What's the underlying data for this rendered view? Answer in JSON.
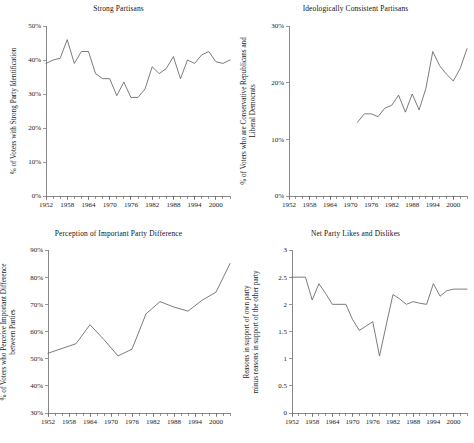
{
  "figure": {
    "background": "#ffffff",
    "line_color": "#5a5a5a",
    "axis_color": "#6b6b6b",
    "text_color": "#1a1a1a"
  },
  "panels": [
    {
      "key": "strong_partisans",
      "title": "Strong Partisans",
      "ylabel": "% of Voters with Strong Party Identification",
      "xlabel": "",
      "ytick_labels": [
        "0%",
        "10%",
        "20%",
        "30%",
        "40%",
        "50%"
      ],
      "xtick_labels": [
        "1952",
        "1958",
        "1964",
        "1970",
        "1976",
        "1982",
        "1988",
        "1994",
        "2000"
      ]
    },
    {
      "key": "ideologically_consistent",
      "title": "Ideologically Consistent Partisans",
      "ylabel_line1": "% of Voters who are Conservative Republicans and",
      "ylabel_line2": "Liberal Democrats",
      "xlabel": "",
      "ytick_labels": [
        "0%",
        "10%",
        "20%",
        "30%"
      ],
      "xtick_labels": [
        "1952",
        "1958",
        "1964",
        "1970",
        "1976",
        "1982",
        "1988",
        "1994",
        "2000"
      ]
    },
    {
      "key": "party_difference",
      "title": "Perception of Important Party Difference",
      "ylabel_line1": "% of Voters who Perceive Important Difference",
      "ylabel_line2": "between Parties",
      "xlabel": "",
      "ytick_labels": [
        "30%",
        "40%",
        "50%",
        "60%",
        "70%",
        "80%",
        "90%"
      ],
      "xtick_labels": [
        "1952",
        "1958",
        "1964",
        "1970",
        "1976",
        "1982",
        "1988",
        "1994",
        "2000"
      ]
    },
    {
      "key": "net_likes_dislikes",
      "title": "Net Party Likes and Dislikes",
      "ylabel_line1": "Reasons in support of own party",
      "ylabel_line2": "minus reasons in support of the other party",
      "xlabel": "",
      "ytick_labels": [
        "0",
        "0.5",
        "1",
        "1.5",
        "2",
        "2.5",
        "3"
      ],
      "xtick_labels": [
        "1952",
        "1958",
        "1964",
        "1970",
        "1976",
        "1982",
        "1988",
        "1994",
        "2000"
      ]
    }
  ],
  "chart_data": [
    {
      "type": "line",
      "title": "Strong Partisans",
      "xlabel": "",
      "ylabel": "% of Voters with Strong Party Identification",
      "xlim": [
        1952,
        2004
      ],
      "ylim": [
        0,
        50
      ],
      "ytick_values": [
        0,
        10,
        20,
        30,
        40,
        50
      ],
      "ytick_labels": [
        "0%",
        "10%",
        "20%",
        "30%",
        "40%",
        "50%"
      ],
      "xtick_values": [
        1952,
        1958,
        1964,
        1970,
        1976,
        1982,
        1988,
        1994,
        2000
      ],
      "minor_xtick_step": 2,
      "grid": false,
      "legend": "none",
      "x": [
        1952,
        1954,
        1956,
        1958,
        1960,
        1962,
        1964,
        1966,
        1968,
        1970,
        1972,
        1974,
        1976,
        1978,
        1980,
        1982,
        1984,
        1986,
        1988,
        1990,
        1992,
        1994,
        1996,
        1998,
        2000,
        2002,
        2004
      ],
      "values": [
        39.0,
        40.0,
        40.5,
        46.0,
        39.0,
        42.5,
        42.5,
        36.0,
        34.5,
        34.5,
        29.5,
        33.5,
        29.0,
        29.0,
        31.5,
        38.0,
        36.0,
        37.5,
        41.0,
        34.5,
        40.0,
        39.0,
        41.5,
        42.5,
        39.5,
        39.0,
        40.0
      ]
    },
    {
      "type": "line",
      "title": "Ideologically Consistent Partisans",
      "xlabel": "",
      "ylabel": "% of Voters who are Conservative Republicans and Liberal Democrats",
      "xlim": [
        1952,
        2004
      ],
      "ylim": [
        0,
        30
      ],
      "ytick_values": [
        0,
        10,
        20,
        30
      ],
      "ytick_labels": [
        "0%",
        "10%",
        "20%",
        "30%"
      ],
      "xtick_values": [
        1952,
        1958,
        1964,
        1970,
        1976,
        1982,
        1988,
        1994,
        2000
      ],
      "minor_xtick_step": 2,
      "grid": false,
      "legend": "none",
      "x": [
        1972,
        1974,
        1976,
        1978,
        1980,
        1982,
        1984,
        1986,
        1988,
        1990,
        1992,
        1994,
        1996,
        1998,
        2000,
        2002,
        2004
      ],
      "values": [
        13.0,
        14.5,
        14.5,
        14.0,
        15.5,
        16.0,
        17.8,
        14.8,
        18.0,
        15.2,
        19.0,
        25.5,
        23.0,
        21.5,
        20.3,
        22.5,
        26.0
      ]
    },
    {
      "type": "line",
      "title": "Perception of Important Party Difference",
      "xlabel": "",
      "ylabel": "% of Voters who Perceive Important Difference between Parties",
      "xlim": [
        1952,
        2004
      ],
      "ylim": [
        30,
        90
      ],
      "ytick_values": [
        30,
        40,
        50,
        60,
        70,
        80,
        90
      ],
      "ytick_labels": [
        "30%",
        "40%",
        "50%",
        "60%",
        "70%",
        "80%",
        "90%"
      ],
      "xtick_values": [
        1952,
        1958,
        1964,
        1970,
        1976,
        1982,
        1988,
        1994,
        2000
      ],
      "minor_xtick_step": 2,
      "grid": false,
      "legend": "none",
      "x": [
        1952,
        1960,
        1964,
        1968,
        1972,
        1976,
        1980,
        1984,
        1988,
        1992,
        1996,
        2000,
        2004
      ],
      "values": [
        52.0,
        55.5,
        62.5,
        57.0,
        51.0,
        53.5,
        66.5,
        71.0,
        69.0,
        67.5,
        71.5,
        74.5,
        85.0
      ]
    },
    {
      "type": "line",
      "title": "Net Party Likes and Dislikes",
      "xlabel": "",
      "ylabel": "Reasons in support of own party minus reasons in support of the other party",
      "xlim": [
        1952,
        2004
      ],
      "ylim": [
        0,
        3
      ],
      "ytick_values": [
        0,
        0.5,
        1,
        1.5,
        2,
        2.5,
        3
      ],
      "ytick_labels": [
        "0",
        "0.5",
        "1",
        "1.5",
        "2",
        "2.5",
        "3"
      ],
      "xtick_values": [
        1952,
        1958,
        1964,
        1970,
        1976,
        1982,
        1988,
        1994,
        2000
      ],
      "minor_xtick_step": 2,
      "grid": false,
      "legend": "none",
      "x": [
        1952,
        1956,
        1958,
        1960,
        1962,
        1964,
        1966,
        1968,
        1970,
        1972,
        1974,
        1976,
        1978,
        1980,
        1982,
        1984,
        1986,
        1988,
        1990,
        1992,
        1994,
        1996,
        1998,
        2000,
        2002,
        2004
      ],
      "values": [
        2.5,
        2.5,
        2.08,
        2.38,
        2.2,
        2.0,
        2.0,
        2.0,
        1.72,
        1.52,
        1.6,
        1.68,
        1.05,
        1.62,
        2.18,
        2.1,
        2.0,
        2.05,
        2.02,
        2.0,
        2.38,
        2.15,
        2.25,
        2.28,
        2.28,
        2.28
      ]
    }
  ]
}
